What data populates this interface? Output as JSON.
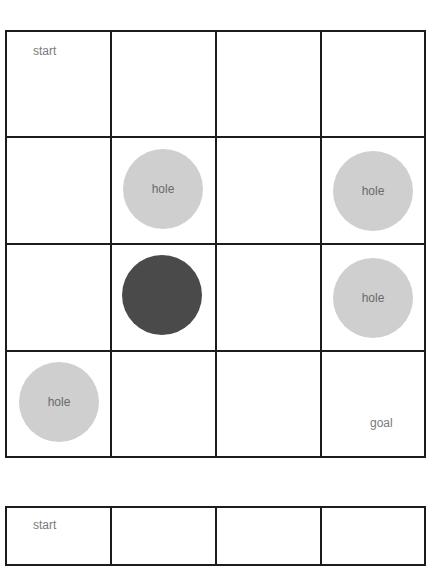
{
  "grids": [
    {
      "rows": 4,
      "cols": 4,
      "labels": {
        "start": "start",
        "goal": "goal",
        "hole": "hole"
      },
      "start_cell": [
        0,
        0
      ],
      "goal_cell": [
        3,
        3
      ],
      "holes": [
        {
          "row": 1,
          "col": 1,
          "label": "hole"
        },
        {
          "row": 1,
          "col": 3,
          "label": "hole"
        },
        {
          "row": 2,
          "col": 3,
          "label": "hole"
        },
        {
          "row": 3,
          "col": 0,
          "label": "hole"
        }
      ],
      "agent": {
        "row": 2,
        "col": 1
      }
    },
    {
      "rows": 4,
      "cols": 4,
      "visible_rows": 1,
      "labels": {
        "start": "start"
      }
    }
  ],
  "colors": {
    "grid_line": "#1c1c1c",
    "hole_fill": "#cfcfcf",
    "agent_fill": "#4a4a4a",
    "label_text": "#7a7a7a"
  }
}
